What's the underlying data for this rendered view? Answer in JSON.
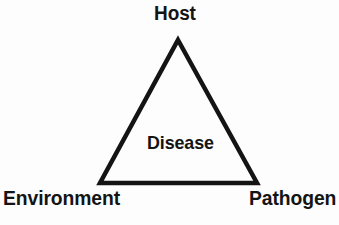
{
  "diagram": {
    "type": "disease-triangle",
    "background_color": "#fdfdfd",
    "stroke_color": "#141414",
    "text_color": "#141414",
    "stroke_width": 4.5,
    "vertices": [
      {
        "id": "host",
        "label": "Host",
        "x": 178,
        "y": 40,
        "position": "top"
      },
      {
        "id": "environment",
        "label": "Environment",
        "x": 100,
        "y": 183,
        "position": "bottom-left"
      },
      {
        "id": "pathogen",
        "label": "Pathogen",
        "x": 257,
        "y": 183,
        "position": "bottom-right"
      }
    ],
    "center": {
      "id": "disease",
      "label": "Disease",
      "x": 178,
      "y": 143
    },
    "labels": {
      "host": "Host",
      "disease": "Disease",
      "environment": "Environment",
      "pathogen": "Pathogen"
    }
  }
}
